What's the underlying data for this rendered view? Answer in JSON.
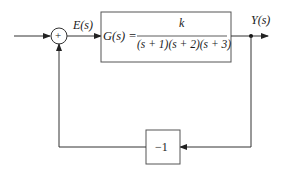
{
  "diagram": {
    "type": "block-diagram",
    "input_signal": "",
    "summing_junction": {
      "sign": "+"
    },
    "error_signal": "E(s)",
    "forward_block": {
      "lhs": "G(s) =",
      "numerator": "k",
      "denominator": "(s + 1)(s + 2)(s + 3)"
    },
    "output_signal": "Y(s)",
    "feedback_block": {
      "label": "−1"
    }
  },
  "colors": {
    "line": "#333333",
    "text": "#1a1a1a",
    "background": "#ffffff"
  }
}
